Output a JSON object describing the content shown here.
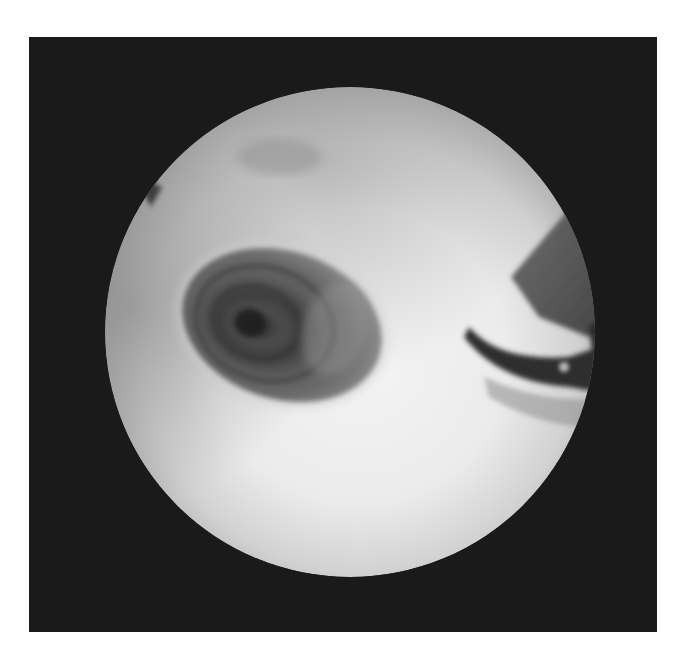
{
  "image": {
    "kind": "grayscale endoscopic photograph",
    "description": "Circular endoscopic field of view on a black frame showing a dark, roughly oval lesion with concentric ring texture at left-center, and a dark angled instrument tip entering from the right edge.",
    "colors": {
      "page_background": "#ffffff",
      "frame_background": "#1a1a1a",
      "field_bright": "#f2f2f2",
      "field_mid": "#bdbdbd",
      "lesion_dark": "#5a5a5a",
      "lesion_core": "#2e2e2e",
      "instrument_dark": "#3a3a3a"
    },
    "regions": {
      "frame": {
        "x": 29,
        "y": 37,
        "width": 628,
        "height": 595
      },
      "view_circle": {
        "cx": 350,
        "cy": 332,
        "r": 245
      },
      "lesion": {
        "cx": 282,
        "cy": 325,
        "rx": 105,
        "ry": 78,
        "rotation_deg": 18
      },
      "instrument": {
        "from_edge": "right",
        "y_range": [
          190,
          380
        ]
      }
    }
  }
}
